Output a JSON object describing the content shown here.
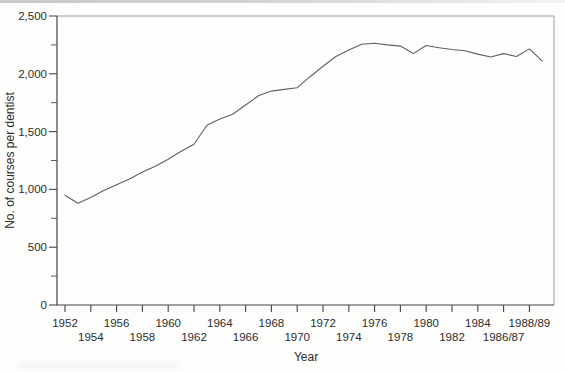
{
  "chart_data": {
    "type": "line",
    "title": "",
    "xlabel": "Year",
    "ylabel": "No. of courses per dentist",
    "ylim": [
      0,
      2500
    ],
    "grid": false,
    "legend": false,
    "ytick_step": 500,
    "ytick_minor_step": 250,
    "ytick_labels": [
      "0",
      "500",
      "1,000",
      "1,500",
      "2,000",
      "2,500"
    ],
    "xtick_labels": [
      "1952",
      "1954",
      "1956",
      "1958",
      "1960",
      "1962",
      "1964",
      "1966",
      "1968",
      "1970",
      "1972",
      "1974",
      "1976",
      "1978",
      "1980",
      "1982",
      "1984",
      "1986/87",
      "1988/89"
    ],
    "xtick_label_rows": "staggered",
    "x": [
      "1952",
      "1953",
      "1954",
      "1955",
      "1956",
      "1957",
      "1958",
      "1959",
      "1960",
      "1961",
      "1962",
      "1963",
      "1964",
      "1965",
      "1966",
      "1967",
      "1968",
      "1969",
      "1970",
      "1971",
      "1972",
      "1973",
      "1974",
      "1975",
      "1976",
      "1977",
      "1978",
      "1979",
      "1980",
      "1981",
      "1982",
      "1983",
      "1984",
      "1985",
      "1986",
      "1987",
      "1988",
      "1988/89"
    ],
    "series": [
      {
        "name": "No. of courses per dentist",
        "values": [
          950,
          880,
          930,
          990,
          1040,
          1090,
          1150,
          1200,
          1260,
          1330,
          1390,
          1555,
          1610,
          1650,
          1730,
          1810,
          1850,
          1865,
          1880,
          1975,
          2065,
          2150,
          2205,
          2255,
          2265,
          2250,
          2240,
          2175,
          2245,
          2225,
          2210,
          2200,
          2170,
          2145,
          2175,
          2150,
          2215,
          2110
        ]
      }
    ]
  },
  "artifacts": {
    "top_scan_band": true,
    "bottom_left_smudge": true
  }
}
